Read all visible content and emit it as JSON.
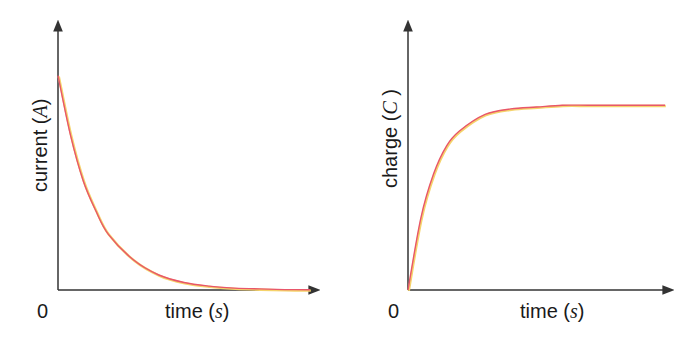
{
  "chart_data": [
    {
      "type": "line",
      "title": "",
      "xlabel": "time",
      "xlabel_unit": "s",
      "ylabel": "current",
      "ylabel_unit": "A",
      "origin_label": "0",
      "grid": false,
      "xlim": [
        0,
        5
      ],
      "ylim": [
        0,
        1.25
      ],
      "series": [
        {
          "name": "current",
          "function": "exponential decay I0*e^(-t/tau)",
          "x": [
            0,
            0.25,
            0.5,
            0.75,
            1,
            1.5,
            2,
            2.5,
            3,
            3.5,
            4,
            4.5,
            5
          ],
          "y": [
            1.0,
            0.72,
            0.51,
            0.37,
            0.26,
            0.14,
            0.07,
            0.035,
            0.018,
            0.009,
            0.005,
            0.002,
            0.001
          ]
        }
      ]
    },
    {
      "type": "line",
      "title": "",
      "xlabel": "time",
      "xlabel_unit": "s",
      "ylabel": "charge",
      "ylabel_unit": "C",
      "origin_label": "0",
      "grid": false,
      "xlim": [
        0,
        5
      ],
      "ylim": [
        0,
        1.45
      ],
      "series": [
        {
          "name": "charge",
          "function": "exponential rise Q0*(1-e^(-t/tau))",
          "x": [
            0,
            0.25,
            0.5,
            0.75,
            1,
            1.5,
            2,
            2.5,
            3,
            3.5,
            4,
            4.5,
            5
          ],
          "y": [
            0,
            0.39,
            0.63,
            0.78,
            0.86,
            0.95,
            0.98,
            0.99,
            1.0,
            1.0,
            1.0,
            1.0,
            1.0
          ]
        }
      ]
    }
  ],
  "style": {
    "axis_color": "#333333",
    "curve_color": "#e8566a",
    "curve_glow": "#f5d36b"
  }
}
